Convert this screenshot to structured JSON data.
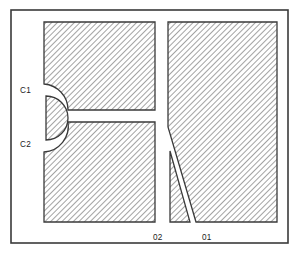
{
  "figure": {
    "type": "technical-line-drawing",
    "background_color": "#ffffff",
    "outline_color": "#3a3a3a",
    "hatch_color": "#555555",
    "hatch_fill_background": "#ffffff",
    "frame": {
      "name": "outer-border",
      "x": 11,
      "y": 10,
      "width": 277,
      "height": 233,
      "stroke_width": 1.6
    },
    "labels": [
      {
        "id": "c1",
        "text": "C1",
        "x": 20,
        "y": 91
      },
      {
        "id": "c2",
        "text": "C2",
        "x": 20,
        "y": 145
      },
      {
        "id": "o2",
        "text": "02",
        "x": 153,
        "y": 238
      },
      {
        "id": "o1",
        "text": "01",
        "x": 202,
        "y": 238
      }
    ],
    "regions": [
      {
        "id": "upper-left-block",
        "name": "hatched-region-upper-left",
        "path": "M 44 22 L 155 22 L 155 110 L 68 110 A 26 26 0 0 0 44 84 Z"
      },
      {
        "id": "lower-left-block",
        "name": "hatched-region-lower-left",
        "path": "M 44 152 L 44 222 L 155 222 L 155 122 L 68 122 A 26 26 0 0 1 44 152 Z"
      },
      {
        "id": "d-core",
        "name": "hatched-region-d-core",
        "path": "M 46 96 L 46 140 A 22 22 0 0 0 46 96 Z"
      },
      {
        "id": "right-main-block",
        "name": "hatched-region-right-main",
        "path": "M 168 22 L 277 22 L 277 222 L 196 222 L 168 127 Z"
      },
      {
        "id": "right-triangle-block",
        "name": "hatched-region-right-triangle",
        "path": "M 170 151 L 170 222 L 190 222 Z"
      }
    ]
  }
}
